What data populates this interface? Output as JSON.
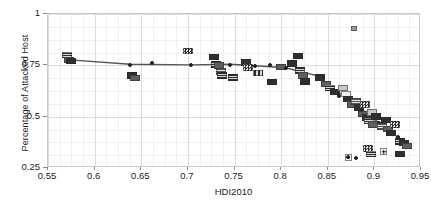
{
  "chart_data": {
    "type": "scatter",
    "title": "",
    "xlabel": "HDI2010",
    "ylabel": "Percentage of Attacked Host",
    "xlim": [
      0.55,
      0.95
    ],
    "ylim": [
      0.25,
      1.0
    ],
    "xticks": [
      "0.55",
      "0.6",
      "0.65",
      "0.7",
      "0.75",
      "0.8",
      "0.85",
      "0.9",
      "0.95"
    ],
    "xtick_values": [
      0.55,
      0.6,
      0.65,
      0.7,
      0.75,
      0.8,
      0.85,
      0.9,
      0.95
    ],
    "yticks": [
      "0.25",
      "0.5",
      "0.75",
      "1"
    ],
    "ytick_values": [
      0.25,
      0.5,
      0.75,
      1.0
    ],
    "grid": true,
    "grid_minor": true,
    "legend": "none",
    "marker_style": "flag-image",
    "points": [
      {
        "x": 0.57,
        "y": 0.8,
        "style": "mk-striped"
      },
      {
        "x": 0.572,
        "y": 0.775,
        "style": "mk-mid"
      },
      {
        "x": 0.575,
        "y": 0.77,
        "style": "mk-dark"
      },
      {
        "x": 0.638,
        "y": 0.752,
        "style": "mk-circle"
      },
      {
        "x": 0.64,
        "y": 0.7,
        "style": "mk-dark"
      },
      {
        "x": 0.643,
        "y": 0.688,
        "style": "mk-mid"
      },
      {
        "x": 0.7,
        "y": 0.82,
        "style": "mk-checker"
      },
      {
        "x": 0.703,
        "y": 0.752,
        "style": "mk-circle"
      },
      {
        "x": 0.728,
        "y": 0.79,
        "style": "mk-dark"
      },
      {
        "x": 0.73,
        "y": 0.755,
        "style": "mk-striped"
      },
      {
        "x": 0.733,
        "y": 0.748,
        "style": "mk-mid"
      },
      {
        "x": 0.735,
        "y": 0.72,
        "style": "mk-striped-mid"
      },
      {
        "x": 0.737,
        "y": 0.7,
        "style": "mk-striped"
      },
      {
        "x": 0.745,
        "y": 0.75,
        "style": "mk-circle"
      },
      {
        "x": 0.762,
        "y": 0.765,
        "style": "mk-dark"
      },
      {
        "x": 0.765,
        "y": 0.74,
        "style": "mk-checker"
      },
      {
        "x": 0.772,
        "y": 0.748,
        "style": "mk-circle"
      },
      {
        "x": 0.775,
        "y": 0.712,
        "style": "mk-vert"
      },
      {
        "x": 0.8,
        "y": 0.742,
        "style": "mk-mid"
      },
      {
        "x": 0.805,
        "y": 0.735,
        "style": "mk-circle"
      },
      {
        "x": 0.812,
        "y": 0.76,
        "style": "mk-dark"
      },
      {
        "x": 0.818,
        "y": 0.795,
        "style": "mk-dark"
      },
      {
        "x": 0.82,
        "y": 0.726,
        "style": "mk-striped"
      },
      {
        "x": 0.823,
        "y": 0.7,
        "style": "mk-mid"
      },
      {
        "x": 0.826,
        "y": 0.672,
        "style": "mk-dark"
      },
      {
        "x": 0.838,
        "y": 0.7,
        "style": "mk-circle"
      },
      {
        "x": 0.842,
        "y": 0.69,
        "style": "mk-dark"
      },
      {
        "x": 0.848,
        "y": 0.66,
        "style": "mk-mid"
      },
      {
        "x": 0.852,
        "y": 0.64,
        "style": "mk-striped"
      },
      {
        "x": 0.858,
        "y": 0.62,
        "style": "mk-dark"
      },
      {
        "x": 0.862,
        "y": 0.6,
        "style": "mk-circle"
      },
      {
        "x": 0.866,
        "y": 0.64,
        "style": "mk-light"
      },
      {
        "x": 0.87,
        "y": 0.61,
        "style": "mk-pale"
      },
      {
        "x": 0.872,
        "y": 0.585,
        "style": "mk-dark"
      },
      {
        "x": 0.876,
        "y": 0.56,
        "style": "mk-mid"
      },
      {
        "x": 0.878,
        "y": 0.93,
        "style": "mk-halo"
      },
      {
        "x": 0.88,
        "y": 0.575,
        "style": "mk-striped-mid"
      },
      {
        "x": 0.883,
        "y": 0.545,
        "style": "mk-dark"
      },
      {
        "x": 0.886,
        "y": 0.53,
        "style": "mk-circle"
      },
      {
        "x": 0.888,
        "y": 0.512,
        "style": "mk-mid"
      },
      {
        "x": 0.89,
        "y": 0.56,
        "style": "mk-checker"
      },
      {
        "x": 0.892,
        "y": 0.495,
        "style": "mk-dark"
      },
      {
        "x": 0.894,
        "y": 0.478,
        "style": "mk-striped"
      },
      {
        "x": 0.897,
        "y": 0.52,
        "style": "mk-light"
      },
      {
        "x": 0.899,
        "y": 0.462,
        "style": "mk-mid"
      },
      {
        "x": 0.902,
        "y": 0.5,
        "style": "mk-dark"
      },
      {
        "x": 0.905,
        "y": 0.47,
        "style": "mk-circle"
      },
      {
        "x": 0.908,
        "y": 0.452,
        "style": "mk-striped-mid"
      },
      {
        "x": 0.912,
        "y": 0.485,
        "style": "mk-dark"
      },
      {
        "x": 0.915,
        "y": 0.44,
        "style": "mk-mid"
      },
      {
        "x": 0.918,
        "y": 0.42,
        "style": "mk-dark"
      },
      {
        "x": 0.922,
        "y": 0.462,
        "style": "mk-checker"
      },
      {
        "x": 0.925,
        "y": 0.4,
        "style": "mk-circle"
      },
      {
        "x": 0.928,
        "y": 0.38,
        "style": "mk-striped"
      },
      {
        "x": 0.932,
        "y": 0.372,
        "style": "mk-dark"
      },
      {
        "x": 0.935,
        "y": 0.358,
        "style": "mk-mid"
      },
      {
        "x": 0.872,
        "y": 0.302,
        "style": "mk-cross"
      },
      {
        "x": 0.88,
        "y": 0.298,
        "style": "mk-circle"
      },
      {
        "x": 0.893,
        "y": 0.345,
        "style": "mk-checker"
      },
      {
        "x": 0.896,
        "y": 0.318,
        "style": "mk-striped"
      },
      {
        "x": 0.91,
        "y": 0.33,
        "style": "mk-cross"
      },
      {
        "x": 0.928,
        "y": 0.318,
        "style": "mk-dark"
      },
      {
        "x": 0.662,
        "y": 0.76,
        "style": "mk-circle"
      },
      {
        "x": 0.788,
        "y": 0.752,
        "style": "mk-circle"
      },
      {
        "x": 0.748,
        "y": 0.69,
        "style": "mk-striped"
      },
      {
        "x": 0.79,
        "y": 0.668,
        "style": "mk-dark"
      }
    ],
    "trend_line": {
      "name": "fitted trend",
      "color": "#555555",
      "points": [
        {
          "x": 0.57,
          "y": 0.778
        },
        {
          "x": 0.638,
          "y": 0.755
        },
        {
          "x": 0.703,
          "y": 0.752
        },
        {
          "x": 0.745,
          "y": 0.755
        },
        {
          "x": 0.772,
          "y": 0.748
        },
        {
          "x": 0.805,
          "y": 0.738
        },
        {
          "x": 0.838,
          "y": 0.7
        },
        {
          "x": 0.862,
          "y": 0.618
        },
        {
          "x": 0.886,
          "y": 0.538
        },
        {
          "x": 0.905,
          "y": 0.47
        },
        {
          "x": 0.925,
          "y": 0.4
        },
        {
          "x": 0.937,
          "y": 0.368
        }
      ]
    }
  }
}
